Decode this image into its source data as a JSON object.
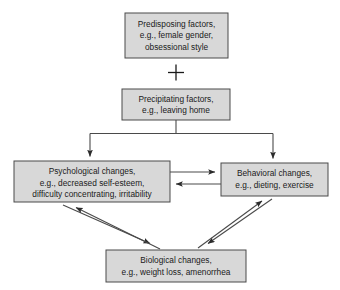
{
  "diagram": {
    "operator_symbol": "+",
    "nodes": [
      {
        "id": "predisposing",
        "name": "predisposing-factors-box",
        "lines": [
          "Predisposing factors,",
          "e.g., female gender,",
          "obsessional style"
        ],
        "x": 125,
        "y": 13,
        "w": 103,
        "h": 45
      },
      {
        "id": "precipitating",
        "name": "precipitating-factors-box",
        "lines": [
          "Precipitating factors,",
          "e.g., leaving home"
        ],
        "x": 122,
        "y": 89,
        "w": 108,
        "h": 31
      },
      {
        "id": "psychological",
        "name": "psychological-changes-box",
        "lines": [
          "Psychological changes,",
          "e.g., decreased self-esteem,",
          "difficulty concentrating, irritability"
        ],
        "x": 14,
        "y": 161,
        "w": 156,
        "h": 41
      },
      {
        "id": "behavioral",
        "name": "behavioral-changes-box",
        "lines": [
          "Behavioral changes,",
          "e.g., dieting, exercise"
        ],
        "x": 221,
        "y": 163,
        "w": 107,
        "h": 33
      },
      {
        "id": "biological",
        "name": "biological-changes-box",
        "lines": [
          "Biological changes,",
          "e.g., weight loss, amenorrhea"
        ],
        "x": 106,
        "y": 250,
        "w": 140,
        "h": 32
      }
    ],
    "edges": [
      {
        "id": "precip-to-psych",
        "from": "precipitating",
        "to": "psychological",
        "direction": "one-way"
      },
      {
        "id": "precip-to-behav",
        "from": "precipitating",
        "to": "behavioral",
        "direction": "one-way"
      },
      {
        "id": "psych-to-behav",
        "from": "psychological",
        "to": "behavioral",
        "direction": "one-way"
      },
      {
        "id": "behav-to-psych",
        "from": "behavioral",
        "to": "psychological",
        "direction": "one-way"
      },
      {
        "id": "psych-biol",
        "from": "psychological",
        "to": "biological",
        "direction": "two-way"
      },
      {
        "id": "behav-biol",
        "from": "behavioral",
        "to": "biological",
        "direction": "two-way"
      }
    ],
    "colors": {
      "box_fill": "#d8d8d8",
      "box_border": "#4a4a4a",
      "text": "#1a1a1a",
      "arrow": "#4a4a4a",
      "background": "#ffffff"
    }
  }
}
